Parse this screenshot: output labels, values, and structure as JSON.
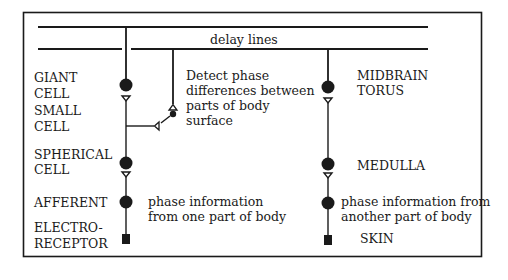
{
  "diagram": {
    "title": "delay lines",
    "left_pathway": {
      "labels": {
        "giant_cell": [
          "GIANT",
          "CELL"
        ],
        "small_cell": [
          "SMALL",
          "CELL"
        ],
        "spherical_cell": [
          "SPHERICAL",
          "CELL"
        ],
        "afferent": [
          "AFFERENT"
        ],
        "electroreceptor": [
          "ELECTRO-",
          "RECEPTOR"
        ]
      },
      "annotation_detect": [
        "Detect phase",
        "differences between",
        "parts of body",
        "surface"
      ],
      "annotation_phase": [
        "phase information",
        "from one part of body"
      ]
    },
    "right_pathway": {
      "labels": {
        "midbrain_torus": [
          "MIDBRAIN",
          "TORUS"
        ],
        "medulla": [
          "MEDULLA"
        ],
        "skin": [
          "SKIN"
        ]
      },
      "annotation_phase": [
        "phase information from",
        "another part of body"
      ]
    },
    "colors": {
      "ink": "#1a1a1a",
      "background": "#ffffff"
    }
  }
}
